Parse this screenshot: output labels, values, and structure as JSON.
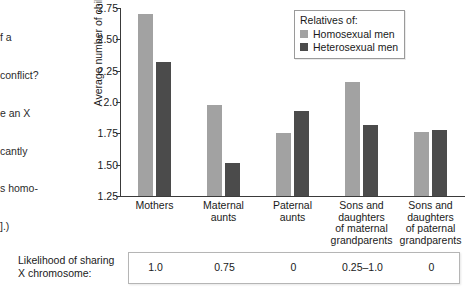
{
  "margin_text": {
    "lines": [
      "f a",
      "conflict?",
      "e an X",
      "cantly",
      "s homo-",
      "].)"
    ]
  },
  "chart_data": {
    "type": "bar",
    "title": "",
    "xlabel": "",
    "ylabel": "Average number of children",
    "ylim": [
      1.25,
      2.75
    ],
    "yticks": [
      "1.25",
      "1.50",
      "1.75",
      "2.0",
      "2.25",
      "2.50",
      "2.75"
    ],
    "ytick_values": [
      1.25,
      1.5,
      1.75,
      2.0,
      2.25,
      2.5,
      2.75
    ],
    "grid": false,
    "legend_position": "top-right",
    "legend_title": "Relatives of:",
    "categories": [
      "Mothers",
      "Maternal\naunts",
      "Paternal\naunts",
      "Sons and\ndaughters\nof maternal\ngrandparents",
      "Sons and\ndaughters\nof paternal\ngrandparents"
    ],
    "series": [
      {
        "name": "Homosexual men",
        "color": "#a2a2a2",
        "values": [
          2.7,
          1.98,
          1.75,
          2.16,
          1.76
        ]
      },
      {
        "name": "Heterosexual men",
        "color": "#4b4b4b",
        "values": [
          2.32,
          1.51,
          1.93,
          1.82,
          1.78
        ]
      }
    ]
  },
  "legend": {
    "title": "Relatives of:",
    "items": [
      {
        "label": "Homosexual men",
        "color": "#a2a2a2"
      },
      {
        "label": "Heterosexual men",
        "color": "#4b4b4b"
      }
    ]
  },
  "bottom_table": {
    "label_line1": "Likelihood of sharing",
    "label_line2": "X chromosome:",
    "values": [
      "1.0",
      "0.75",
      "0",
      "0.25–1.0",
      "0"
    ]
  },
  "colors": {
    "series_light": "#a2a2a2",
    "series_dark": "#4b4b4b",
    "axis": "#3a3a3a",
    "text": "#1a1a1a",
    "table_border": "#b5b5b5"
  }
}
